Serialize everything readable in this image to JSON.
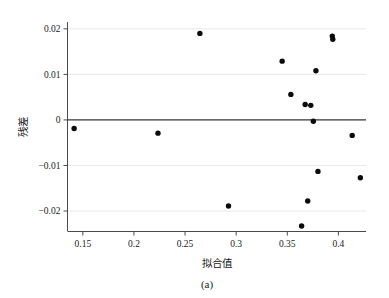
{
  "figure": {
    "caption": "(a)",
    "background_color": "#ffffff",
    "point_color": "#0b0b0b",
    "grid_color": "#e8e8ee",
    "axis_color": "#4a4a4a"
  },
  "chart_data": {
    "type": "scatter",
    "title": "",
    "subtitle": "",
    "xlabel": "拟合值",
    "ylabel": "残差",
    "xlim": [
      0.135,
      0.427
    ],
    "ylim": [
      -0.0245,
      0.0215
    ],
    "grid": true,
    "legend": null,
    "legend_position": "none",
    "xticks": [
      0.15,
      0.2,
      0.25,
      0.3,
      0.35,
      0.4
    ],
    "xtick_labels": [
      "0.15",
      "0.2",
      "0.25",
      "0.3",
      "0.35",
      "0.4"
    ],
    "yticks": [
      0.02,
      0.01,
      0,
      -0.01,
      -0.02
    ],
    "ytick_labels": [
      "0.02",
      "0.01",
      "0",
      "−0.01",
      "−0.02"
    ],
    "reference_lines": [
      {
        "orientation": "horizontal",
        "value": 0,
        "color": "#3a3a3a"
      }
    ],
    "series": [
      {
        "name": "residuals",
        "marker": "circle",
        "color": "#0b0b0b",
        "points": [
          {
            "x": 0.1415,
            "y": -0.0019
          },
          {
            "x": 0.2235,
            "y": -0.0029
          },
          {
            "x": 0.2645,
            "y": 0.019
          },
          {
            "x": 0.2925,
            "y": -0.0189
          },
          {
            "x": 0.345,
            "y": 0.0129
          },
          {
            "x": 0.3535,
            "y": 0.0056
          },
          {
            "x": 0.364,
            "y": -0.0233
          },
          {
            "x": 0.3675,
            "y": 0.0034
          },
          {
            "x": 0.37,
            "y": -0.0178
          },
          {
            "x": 0.373,
            "y": 0.0032
          },
          {
            "x": 0.3755,
            "y": -0.0003
          },
          {
            "x": 0.378,
            "y": 0.0108
          },
          {
            "x": 0.38,
            "y": -0.0113
          },
          {
            "x": 0.394,
            "y": 0.0184
          },
          {
            "x": 0.3945,
            "y": 0.0177
          },
          {
            "x": 0.4135,
            "y": -0.0034
          },
          {
            "x": 0.4215,
            "y": -0.0127
          }
        ]
      }
    ]
  }
}
